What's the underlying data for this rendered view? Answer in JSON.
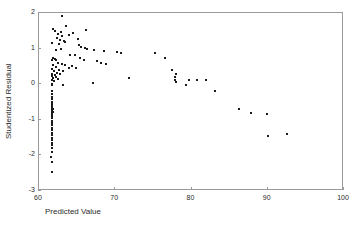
{
  "chart_data": {
    "type": "scatter",
    "title": "",
    "xlabel": "Predicted Value",
    "ylabel": "Studentized Residual",
    "xlim": [
      60,
      100
    ],
    "ylim": [
      -3,
      2
    ],
    "xticks": [
      60,
      70,
      80,
      90,
      100
    ],
    "xtick_labels": [
      "60",
      "70",
      "80",
      "90",
      "100"
    ],
    "yticks": [
      2,
      1,
      0,
      -1,
      -2,
      -3
    ],
    "ytick_labels": [
      "2",
      "1",
      "0",
      "-1",
      "-2",
      "-3"
    ],
    "grid": false,
    "legend": null,
    "marker_color": "#1a1a1a",
    "frame_color": "#9a9a9a",
    "series": [
      {
        "name": "residuals",
        "points": [
          [
            63.1,
            1.89
          ],
          [
            62.0,
            1.52
          ],
          [
            62.2,
            1.47
          ],
          [
            63.7,
            1.61
          ],
          [
            63.0,
            1.44
          ],
          [
            64.6,
            1.42
          ],
          [
            66.3,
            1.5
          ],
          [
            62.6,
            1.37
          ],
          [
            63.2,
            1.32
          ],
          [
            62.5,
            1.28
          ],
          [
            64.1,
            1.34
          ],
          [
            65.2,
            1.23
          ],
          [
            62.9,
            1.2
          ],
          [
            63.4,
            1.19
          ],
          [
            63.6,
            1.16
          ],
          [
            61.9,
            1.13
          ],
          [
            62.7,
            1.1
          ],
          [
            65.4,
            1.06
          ],
          [
            65.7,
            1.02
          ],
          [
            63.0,
            0.97
          ],
          [
            62.3,
            0.93
          ],
          [
            66.1,
            0.99
          ],
          [
            66.4,
            0.96
          ],
          [
            67.4,
            0.92
          ],
          [
            68.6,
            0.91
          ],
          [
            70.3,
            0.88
          ],
          [
            70.9,
            0.85
          ],
          [
            64.2,
            0.8
          ],
          [
            64.9,
            0.78
          ],
          [
            62.0,
            0.72
          ],
          [
            62.2,
            0.68
          ],
          [
            62.4,
            0.66
          ],
          [
            61.8,
            0.64
          ],
          [
            65.5,
            0.7
          ],
          [
            66.0,
            0.66
          ],
          [
            67.7,
            0.62
          ],
          [
            68.3,
            0.58
          ],
          [
            68.9,
            0.55
          ],
          [
            62.6,
            0.58
          ],
          [
            63.1,
            0.55
          ],
          [
            62.0,
            0.52
          ],
          [
            63.5,
            0.5
          ],
          [
            64.4,
            0.48
          ],
          [
            62.3,
            0.45
          ],
          [
            64.0,
            0.44
          ],
          [
            65.0,
            0.42
          ],
          [
            61.9,
            0.4
          ],
          [
            62.8,
            0.38
          ],
          [
            63.3,
            0.35
          ],
          [
            62.1,
            0.33
          ],
          [
            62.5,
            0.3
          ],
          [
            61.8,
            0.27
          ],
          [
            62.9,
            0.26
          ],
          [
            62.2,
            0.22
          ],
          [
            61.9,
            0.19
          ],
          [
            62.4,
            0.17
          ],
          [
            62.0,
            0.14
          ],
          [
            62.6,
            0.12
          ],
          [
            61.8,
            0.1
          ],
          [
            62.1,
            0.07
          ],
          [
            75.4,
            0.84
          ],
          [
            76.7,
            0.7
          ],
          [
            77.6,
            0.37
          ],
          [
            78.1,
            0.25
          ],
          [
            78.0,
            0.17
          ],
          [
            78.0,
            0.08
          ],
          [
            78.1,
            0.04
          ],
          [
            79.4,
            -0.04
          ],
          [
            79.8,
            0.08
          ],
          [
            80.9,
            0.09
          ],
          [
            82.0,
            0.08
          ],
          [
            71.9,
            0.15
          ],
          [
            67.2,
            0.0
          ],
          [
            63.3,
            -0.06
          ],
          [
            61.8,
            -0.02
          ],
          [
            61.9,
            -0.05
          ],
          [
            83.2,
            -0.22
          ],
          [
            61.9,
            -0.22
          ],
          [
            61.8,
            -0.3
          ],
          [
            61.9,
            -0.38
          ],
          [
            61.8,
            -0.45
          ],
          [
            61.9,
            -0.52
          ],
          [
            61.8,
            -0.58
          ],
          [
            61.9,
            -0.64
          ],
          [
            61.8,
            -0.7
          ],
          [
            62.0,
            -0.72
          ],
          [
            61.9,
            -0.75
          ],
          [
            61.8,
            -0.78
          ],
          [
            62.0,
            -0.8
          ],
          [
            61.9,
            -0.83
          ],
          [
            61.8,
            -0.86
          ],
          [
            61.9,
            -0.92
          ],
          [
            61.8,
            -0.98
          ],
          [
            61.9,
            -1.05
          ],
          [
            61.8,
            -1.12
          ],
          [
            61.9,
            -1.18
          ],
          [
            61.8,
            -1.25
          ],
          [
            61.9,
            -1.32
          ],
          [
            61.8,
            -1.39
          ],
          [
            61.9,
            -1.46
          ],
          [
            61.8,
            -1.53
          ],
          [
            61.9,
            -1.6
          ],
          [
            61.8,
            -1.67
          ],
          [
            61.9,
            -1.74
          ],
          [
            61.8,
            -1.82
          ],
          [
            61.9,
            -1.94
          ],
          [
            61.7,
            -2.06
          ],
          [
            61.9,
            -2.22
          ],
          [
            61.8,
            -2.5
          ],
          [
            86.4,
            -0.72
          ],
          [
            87.9,
            -0.83
          ],
          [
            90.0,
            -0.86
          ],
          [
            90.1,
            -1.47
          ],
          [
            92.7,
            -1.44
          ]
        ]
      }
    ]
  },
  "axes": {
    "x_label": "Predicted Value",
    "y_label": "Studentized Residual"
  }
}
